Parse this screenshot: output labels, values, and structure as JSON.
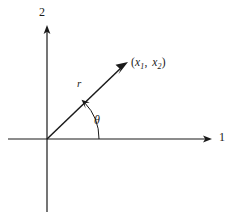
{
  "figure": {
    "type": "polar-coordinate-diagram",
    "background_color": "#ffffff",
    "stroke_color": "#1a1a1a",
    "axes": {
      "horizontal_label": "1",
      "vertical_label": "2",
      "origin": {
        "x": 47,
        "y": 139
      },
      "horizontal_extent": {
        "start_x": 8,
        "end_x": 212
      },
      "vertical_extent": {
        "start_y": 25,
        "end_y": 212
      }
    },
    "vector": {
      "magnitude_label": "r",
      "angle_label": "θ",
      "endpoint_label_parts": {
        "open_paren": "(",
        "x_symbol": "x",
        "x_subscript": "1",
        "comma": ",",
        "y_symbol": "x",
        "y_subscript": "2",
        "close_paren": ")"
      },
      "endpoint_label_full": "(x₁, x₂)",
      "tip": {
        "x": 128,
        "y": 62
      }
    },
    "arc": {
      "radius": 52,
      "start_angle_deg": 0,
      "end_angle_deg": 45
    }
  }
}
